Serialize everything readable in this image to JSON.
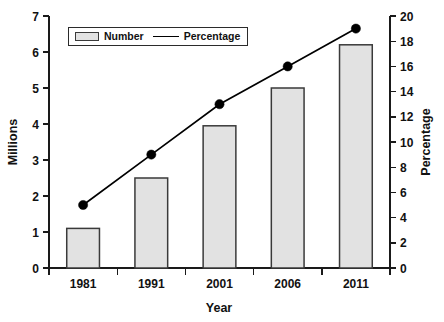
{
  "chart_data": {
    "type": "bar",
    "title": "",
    "subtitle": "",
    "xlabel": "Year",
    "ylabel": "Millions",
    "y2label": "Percentage",
    "categories": [
      "1981",
      "1991",
      "2001",
      "2006",
      "2011"
    ],
    "ylim": [
      0,
      7
    ],
    "y2lim": [
      0,
      20
    ],
    "yticks": [
      "0",
      "1",
      "2",
      "3",
      "4",
      "5",
      "6",
      "7"
    ],
    "y2ticks": [
      "0",
      "2",
      "4",
      "6",
      "8",
      "10",
      "12",
      "14",
      "16",
      "18",
      "20"
    ],
    "grid": false,
    "legend_position": "top-left",
    "series": [
      {
        "name": "Number",
        "type": "bar",
        "axis": "left",
        "unit": "Millions",
        "values": [
          1.1,
          2.5,
          3.95,
          5.0,
          6.2
        ],
        "fill_color": "#e2e2e2",
        "edge_color": "#3a3a3a"
      },
      {
        "name": "Percentage",
        "type": "line",
        "axis": "right",
        "unit": "Percentage",
        "values": [
          5,
          9,
          13,
          16,
          19
        ],
        "line_color": "#000000",
        "marker": "circle"
      }
    ]
  },
  "legend": {
    "items": [
      {
        "label": "Number",
        "swatch": "bar-swatch"
      },
      {
        "label": "Percentage",
        "swatch": "line-swatch"
      }
    ]
  },
  "axes": {
    "left_title": "Millions",
    "right_title": "Percentage",
    "x_title": "Year"
  }
}
